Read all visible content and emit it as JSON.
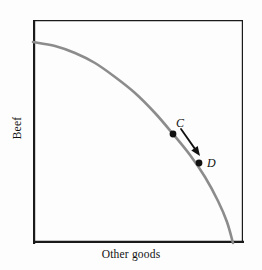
{
  "figure": {
    "background_color": "#fdfdfd",
    "frame": {
      "x": 33,
      "y": 20,
      "width": 210,
      "height": 223,
      "stroke_color": "#1a1a1a",
      "left_bottom_stroke_width": 2.2,
      "top_right_stroke_width": 1.2
    }
  },
  "axes": {
    "x_label": "Other goods",
    "y_label": "Beef",
    "x_label_color": "#111111",
    "y_label_color": "#111111"
  },
  "chart_data": {
    "type": "line",
    "title": "",
    "subtitle": "",
    "xlabel": "Other goods",
    "ylabel": "Beef",
    "xlim": [
      0,
      1
    ],
    "ylim": [
      0,
      1
    ],
    "grid": false,
    "legend": null,
    "series": [
      {
        "name": "production-possibilities-frontier",
        "kind": "curve",
        "color": "#8c8c8c",
        "stroke_width": 2.6,
        "description": "Concave production possibilities frontier from the beef axis down to the other-goods axis",
        "points_px": [
          [
            33,
            42
          ],
          [
            55,
            46
          ],
          [
            75,
            53
          ],
          [
            95,
            63
          ],
          [
            115,
            77
          ],
          [
            135,
            93
          ],
          [
            155,
            113
          ],
          [
            173,
            134
          ],
          [
            190,
            155
          ],
          [
            205,
            177
          ],
          [
            218,
            201
          ],
          [
            227,
            222
          ],
          [
            233,
            243
          ]
        ]
      }
    ],
    "annotations": [
      {
        "name": "point-C",
        "label": "C",
        "style": "italic",
        "marker": "filled-circle",
        "marker_color": "#111111",
        "marker_radius_px": 3.4,
        "x_px": 173,
        "y_px": 134,
        "label_x_px": 176,
        "label_y_px": 117
      },
      {
        "name": "point-D",
        "label": "D",
        "style": "italic",
        "marker": "filled-circle",
        "marker_color": "#111111",
        "marker_radius_px": 3.4,
        "x_px": 199,
        "y_px": 163,
        "label_x_px": 207,
        "label_y_px": 157
      },
      {
        "name": "arrow-c-to-d",
        "kind": "arrow",
        "color": "#111111",
        "stroke_width": 1.8,
        "from_px": [
          181,
          129
        ],
        "to_px": [
          200,
          156
        ],
        "head": "solid-triangle"
      }
    ]
  }
}
